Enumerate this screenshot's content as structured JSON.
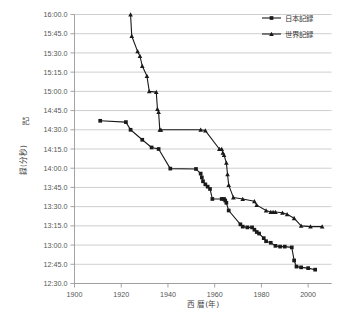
{
  "chart_data": {
    "type": "line",
    "title": "",
    "xlabel": "西 暦(年)",
    "ylabel": "記録(分秒)",
    "xlim": [
      1900,
      2010
    ],
    "ylim": [
      12.5,
      16.0
    ],
    "grid": true,
    "legend_position": "top-right",
    "xticks": [
      1900,
      1920,
      1940,
      1960,
      1980,
      2000
    ],
    "xtick_labels": [
      "1900",
      "1920",
      "1940",
      "1960",
      "1980",
      "2000"
    ],
    "yticks": [
      16.0,
      15.75,
      15.5,
      15.25,
      15.0,
      14.75,
      14.5,
      14.25,
      14.0,
      13.75,
      13.5,
      13.25,
      13.0,
      12.75,
      12.5
    ],
    "ytick_labels": [
      "16:00.0",
      "15:45.0",
      "15:30.0",
      "15:15.0",
      "15:00.0",
      "14:45.0",
      "14:30.0",
      "14:15.0",
      "14:00.0",
      "13:45.0",
      "13:30.0",
      "13:15.0",
      "13:00.0",
      "12:45.0",
      "12:30.0"
    ],
    "series": [
      {
        "name": "日本記録",
        "marker": "square",
        "color": "#1a1a1a",
        "x": [
          1911,
          1922,
          1924,
          1929,
          1933,
          1936,
          1941,
          1952,
          1954,
          1954.5,
          1955,
          1956,
          1957,
          1958,
          1959,
          1963,
          1964,
          1964.5,
          1965,
          1966,
          1971,
          1972,
          1974,
          1976,
          1977,
          1978,
          1979,
          1981,
          1982,
          1984,
          1986,
          1988,
          1990,
          1993,
          1994,
          1995,
          1997,
          2000,
          2003
        ],
        "y": [
          14.617,
          14.6,
          14.5,
          14.37,
          14.27,
          14.25,
          13.995,
          13.99,
          13.93,
          13.88,
          13.83,
          13.79,
          13.76,
          13.73,
          13.6,
          13.6,
          13.6,
          13.58,
          13.55,
          13.45,
          13.27,
          13.24,
          13.23,
          13.23,
          13.2,
          13.17,
          13.15,
          13.09,
          13.05,
          13.03,
          12.99,
          12.98,
          12.98,
          12.97,
          12.8,
          12.72,
          12.71,
          12.7,
          12.68
        ],
        "note": "Japan record, square markers, starts 1911 near 14:37"
      },
      {
        "name": "世界記録",
        "marker": "triangle",
        "color": "#1a1a1a",
        "x": [
          1924,
          1924.5,
          1927,
          1928,
          1929,
          1931,
          1932,
          1935,
          1935.5,
          1936,
          1936.5,
          1937,
          1954,
          1956,
          1962,
          1963,
          1963.5,
          1964,
          1965,
          1965.5,
          1966,
          1968,
          1972,
          1977,
          1978,
          1982,
          1984,
          1985,
          1986,
          1989,
          1991,
          1994,
          1997,
          2001,
          2006
        ],
        "y": [
          16.0,
          15.72,
          15.52,
          15.46,
          15.33,
          15.2,
          15.0,
          14.99,
          14.77,
          14.73,
          14.5,
          14.5,
          14.5,
          14.49,
          14.25,
          14.25,
          14.2,
          14.17,
          14.07,
          13.92,
          13.78,
          13.62,
          13.6,
          13.57,
          13.52,
          13.45,
          13.43,
          13.43,
          13.43,
          13.42,
          13.4,
          13.35,
          13.25,
          13.24,
          13.24
        ],
        "note": "World record, triangle markers, starts 1924 at 16:00 top of axis"
      }
    ]
  },
  "legend": {
    "entries": [
      {
        "label": "日本記録",
        "marker": "square"
      },
      {
        "label": "世界記録",
        "marker": "triangle"
      }
    ]
  },
  "axes": {
    "x_title": "西 暦(年)",
    "y_title_top": "記",
    "y_title_bottom": "録(分秒)"
  }
}
